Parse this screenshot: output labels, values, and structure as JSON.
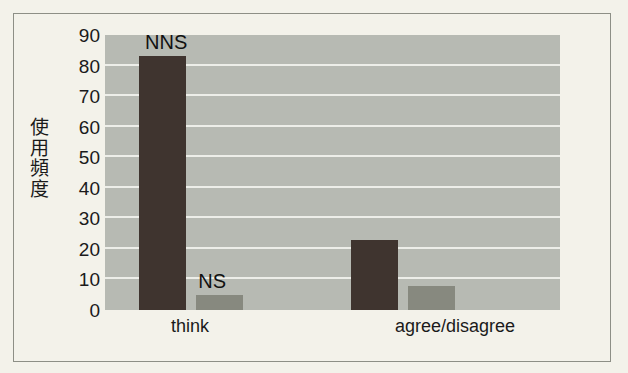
{
  "chart_data": {
    "type": "bar",
    "title": "",
    "xlabel": "",
    "ylabel": "使用頻度",
    "ylabel_chars": [
      "使",
      "用",
      "頻",
      "度"
    ],
    "categories": [
      "think",
      "agree/disagree"
    ],
    "series": [
      {
        "name": "NNS",
        "values": [
          83,
          23
        ],
        "color": "#3f342f"
      },
      {
        "name": "NS",
        "values": [
          5,
          8
        ],
        "color": "#87897f"
      }
    ],
    "ylim": [
      0,
      90
    ],
    "ytick_step": 10,
    "yticks": [
      "90",
      "80",
      "70",
      "60",
      "50",
      "40",
      "30",
      "20",
      "10",
      "0"
    ],
    "grid": true,
    "legend": "inline-annotations",
    "annotations": [
      {
        "text": "NNS",
        "series": "NNS",
        "category": "think"
      },
      {
        "text": "NS",
        "series": "NS",
        "category": "think"
      }
    ],
    "plot_background": "#b7bab3",
    "gridline_color": "#edeee9",
    "figure_background": "#f3f2ea",
    "frame_color": "#8d8f86"
  }
}
